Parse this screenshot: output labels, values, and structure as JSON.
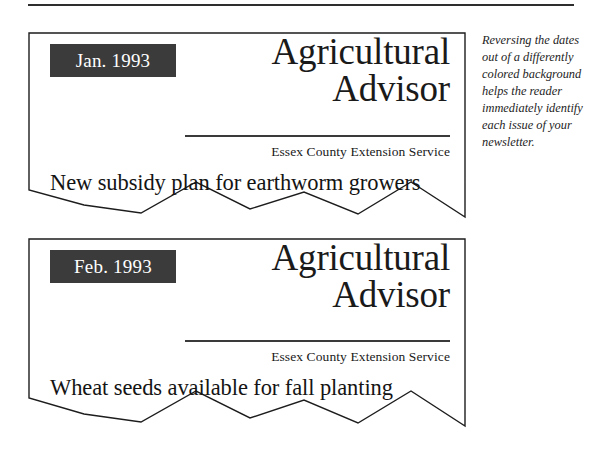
{
  "page": {
    "rule_present": true,
    "background_color": "#ffffff",
    "ink_color": "#1a1a1a"
  },
  "caption": {
    "text": "Reversing the dates out of a differently colored background helps the reader immediately identify each issue of your newsletter."
  },
  "samples": [
    {
      "date_badge": "Jan. 1993",
      "badge_background": "#3b3b3b",
      "badge_text_color": "#ffffff",
      "masthead_line1": "Agricultural",
      "masthead_line2": "Advisor",
      "tagline": "Essex County Extension Service",
      "headline": "New subsidy plan for earthworm growers"
    },
    {
      "date_badge": "Feb. 1993",
      "badge_background": "#3b3b3b",
      "badge_text_color": "#ffffff",
      "masthead_line1": "Agricultural",
      "masthead_line2": "Advisor",
      "tagline": "Essex County Extension Service",
      "headline": "Wheat seeds available for fall planting"
    }
  ]
}
